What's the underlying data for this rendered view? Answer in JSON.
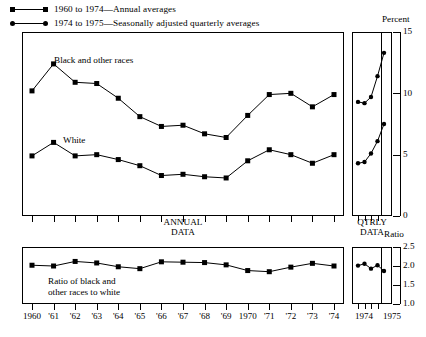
{
  "legend": [
    {
      "marker": "square",
      "label": "1960 to 1974—Annual averages"
    },
    {
      "marker": "circle",
      "label": "1974 to 1975—Seasonally adjusted quarterly averages"
    }
  ],
  "top_panel": {
    "unit_label": "Percent",
    "annual_caption_line1": "ANNUAL",
    "annual_caption_line2": "DATA",
    "qtrly_caption_line1": "QTRLY",
    "qtrly_caption_line2": "DATA",
    "series_label_black": "Black and other races",
    "series_label_white": "White"
  },
  "bottom_panel": {
    "unit_label": "Ratio",
    "annotation_line1": "Ratio of black and",
    "annotation_line2": "other races to white"
  },
  "x_labels": [
    "1960",
    "'61",
    "'62",
    "'63",
    "'64",
    "'65",
    "'66",
    "'67",
    "'68",
    "'69",
    "1970",
    "'71",
    "'72",
    "'73",
    "'74"
  ],
  "x_labels_qtrly": [
    "1974",
    "1975"
  ],
  "chart_data": [
    {
      "type": "line",
      "id": "unemployment-rates",
      "title": "Unemployment rates by race",
      "ylabel": "Percent",
      "xlabel": "ANNUAL DATA",
      "ylim": [
        0,
        15
      ],
      "yticks": [
        0,
        5,
        10,
        15
      ],
      "ytick_labels": [
        "0",
        "5",
        "10",
        "15"
      ],
      "grid": false,
      "legend_position": "top-left",
      "x": [
        1960,
        1961,
        1962,
        1963,
        1964,
        1965,
        1966,
        1967,
        1968,
        1969,
        1970,
        1971,
        1972,
        1973,
        1974
      ],
      "series": [
        {
          "name": "Black and other races",
          "marker": "square",
          "values": [
            10.2,
            12.4,
            10.9,
            10.8,
            9.6,
            8.1,
            7.3,
            7.4,
            6.7,
            6.4,
            8.2,
            9.9,
            10.0,
            8.9,
            9.9
          ]
        },
        {
          "name": "White",
          "marker": "square",
          "values": [
            4.9,
            6.0,
            4.9,
            5.0,
            4.6,
            4.1,
            3.3,
            3.4,
            3.2,
            3.1,
            4.5,
            5.4,
            5.0,
            4.3,
            5.0
          ]
        }
      ]
    },
    {
      "type": "line",
      "id": "unemployment-rates-quarterly",
      "title": "Unemployment rates by race, quarterly",
      "ylabel": "Percent",
      "xlabel": "QTRLY DATA",
      "ylim": [
        0,
        15
      ],
      "x": [
        "1974 Q1",
        "1974 Q2",
        "1974 Q3",
        "1974 Q4",
        "1975 Q1"
      ],
      "series": [
        {
          "name": "Black and other races",
          "marker": "circle",
          "values": [
            9.3,
            9.2,
            9.7,
            11.4,
            13.3
          ]
        },
        {
          "name": "White",
          "marker": "circle",
          "values": [
            4.3,
            4.4,
            5.1,
            6.1,
            7.5
          ]
        }
      ]
    },
    {
      "type": "line",
      "id": "ratio-black-to-white",
      "title": "Ratio of black and other races to white",
      "ylabel": "Ratio",
      "xlabel": "ANNUAL DATA",
      "ylim": [
        1.0,
        2.5
      ],
      "yticks": [
        1.0,
        1.5,
        2.0,
        2.5
      ],
      "ytick_labels": [
        "1.0",
        "1.5",
        "2.0",
        "2.5"
      ],
      "grid": false,
      "x": [
        1960,
        1961,
        1962,
        1963,
        1964,
        1965,
        1966,
        1967,
        1968,
        1969,
        1970,
        1971,
        1972,
        1973,
        1974
      ],
      "series": [
        {
          "name": "Ratio of black and other races to white",
          "marker": "square",
          "values": [
            2.02,
            2.0,
            2.12,
            2.08,
            1.98,
            1.93,
            2.11,
            2.1,
            2.09,
            2.03,
            1.88,
            1.85,
            1.97,
            2.07,
            2.0
          ]
        }
      ]
    },
    {
      "type": "line",
      "id": "ratio-quarterly",
      "title": "Ratio of black and other races to white, quarterly",
      "ylabel": "Ratio",
      "ylim": [
        1.0,
        2.5
      ],
      "x": [
        "1974 Q1",
        "1974 Q2",
        "1974 Q3",
        "1974 Q4",
        "1975 Q1"
      ],
      "series": [
        {
          "name": "Ratio",
          "marker": "circle",
          "values": [
            2.01,
            2.06,
            1.93,
            2.02,
            1.87
          ]
        }
      ]
    }
  ]
}
